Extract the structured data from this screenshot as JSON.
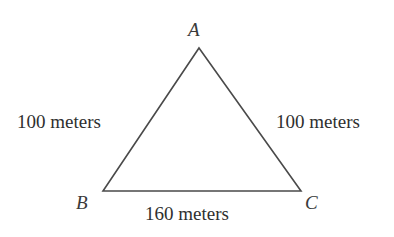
{
  "diagram": {
    "type": "triangle",
    "shape_name": "isosceles-triangle",
    "vertices": [
      {
        "id": "A",
        "label": "A",
        "x": 199,
        "y": 48
      },
      {
        "id": "B",
        "label": "B",
        "x": 103,
        "y": 191
      },
      {
        "id": "C",
        "label": "C",
        "x": 301,
        "y": 191
      }
    ],
    "sides": [
      {
        "id": "AB",
        "label": "100 meters",
        "value": 100,
        "unit": "meters"
      },
      {
        "id": "AC",
        "label": "100 meters",
        "value": 100,
        "unit": "meters"
      },
      {
        "id": "BC",
        "label": "160 meters",
        "value": 160,
        "unit": "meters"
      }
    ],
    "colors": {
      "stroke": "#4a4a4a",
      "background": "#ffffff",
      "text": "#2f2f2f"
    }
  }
}
